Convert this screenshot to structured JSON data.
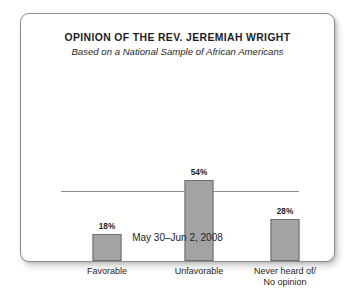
{
  "card": {
    "background": "#ffffff",
    "border_color": "#8d8d8d"
  },
  "header": {
    "title": "OPINION OF THE REV. JEREMIAH WRIGHT",
    "subtitle": "Based on a National Sample of African Americans"
  },
  "footer": {
    "date_range": "May 30–Jun 2, 2008"
  },
  "axis": {
    "baseline_color": "#8f8f8f"
  },
  "bars": [
    {
      "category_line1": "Favorable",
      "category_line2": "",
      "value_label": "18%"
    },
    {
      "category_line1": "Unfavorable",
      "category_line2": "",
      "value_label": "54%"
    },
    {
      "category_line1": "Never heard of/",
      "category_line2": "No opinion",
      "value_label": "28%"
    }
  ],
  "chart_data": {
    "type": "bar",
    "title": "OPINION OF THE REV. JEREMIAH WRIGHT",
    "subtitle": "Based on a National Sample of African Americans",
    "note": "May 30–Jun 2, 2008",
    "categories": [
      "Favorable",
      "Unfavorable",
      "Never heard of/ No opinion"
    ],
    "values": [
      18,
      54,
      28
    ],
    "data_labels": [
      "18%",
      "54%",
      "28%"
    ],
    "xlabel": "",
    "ylabel": "",
    "unit": "percent",
    "ylim": [
      0,
      60
    ],
    "grid": false,
    "legend": false,
    "bar_fill_color": "#a3a3a3",
    "bar_border_color": "#6e6e6e",
    "px_per_unit": 1.5
  }
}
